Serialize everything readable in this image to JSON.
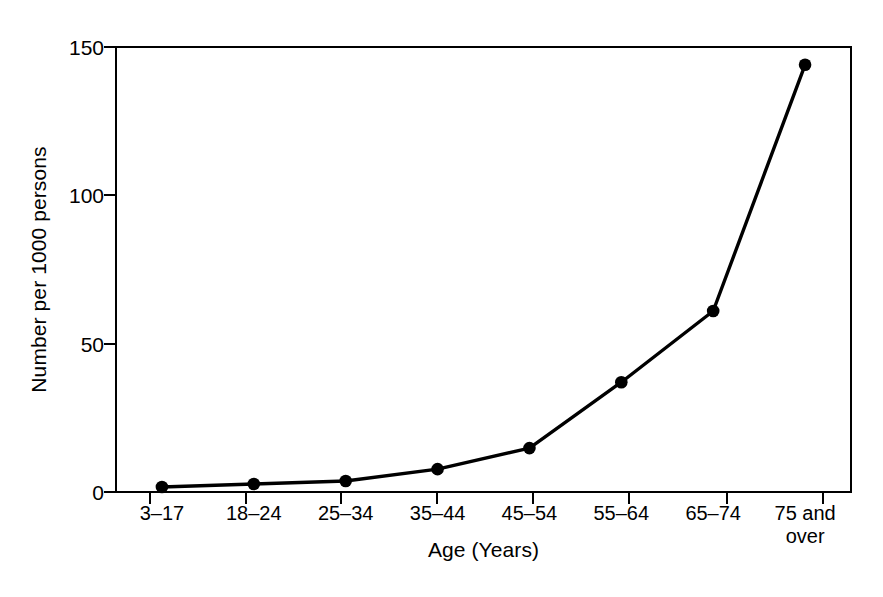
{
  "chart_data": {
    "type": "line",
    "title": "",
    "subtitle": "",
    "xlabel": "Age (Years)",
    "ylabel": "Number per 1000 persons",
    "categories": [
      "3–17",
      "18–24",
      "25–34",
      "35–44",
      "45–54",
      "55–64",
      "65–74",
      "75 and\nover"
    ],
    "values": [
      1.7,
      2.7,
      3.7,
      7.7,
      14.8,
      37,
      61,
      144
    ],
    "series": [
      {
        "name": "Number per 1000 persons",
        "values": [
          1.7,
          2.7,
          3.7,
          7.7,
          14.8,
          37,
          61,
          144
        ]
      }
    ],
    "ylim": [
      0,
      150
    ],
    "yticks": [
      0,
      50,
      100,
      150
    ],
    "ytick_labels": [
      "0",
      "50",
      "100",
      "150"
    ],
    "xtick_labels": [
      "3–17",
      "18–24",
      "25–34",
      "35–44",
      "45–54",
      "55–64",
      "65–74",
      "75 and\nover"
    ],
    "grid": false,
    "legend": false,
    "legend_position": "none",
    "marker": "filled-circle",
    "line_color": "#000000",
    "marker_color": "#000000",
    "axis_color": "#000000",
    "background_color": "#ffffff"
  },
  "axes": {
    "frame": {
      "left": 116,
      "right": 851,
      "top": 47,
      "bottom": 492
    }
  }
}
